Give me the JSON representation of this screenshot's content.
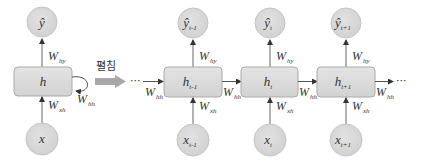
{
  "colors": {
    "node_fill": "#d9d9d9",
    "node_stroke": "#bfbfbf",
    "box_fill": "#dcdcdc",
    "box_stroke": "#a6a6a6",
    "line": "#555555",
    "unfold_arrow": "#a6a6a6",
    "text": "#333333"
  },
  "folded": {
    "output_node": {
      "symbol": "ŷ",
      "sub": ""
    },
    "hidden_box": {
      "symbol": "h",
      "sub": ""
    },
    "input_node": {
      "symbol": "x",
      "sub": ""
    },
    "w_hy": {
      "base": "W",
      "sub": "hy"
    },
    "w_xh": {
      "base": "W",
      "sub": "xh"
    },
    "w_hh": {
      "base": "W",
      "sub": "hh"
    }
  },
  "unfold_label": "펼침",
  "ellipsis": "···",
  "unfolded": [
    {
      "output": {
        "symbol": "ŷ",
        "sub": "t-1"
      },
      "hidden": {
        "symbol": "h",
        "sub": "t-1"
      },
      "input": {
        "symbol": "x",
        "sub": "t-1"
      },
      "w_hy": {
        "base": "W",
        "sub": "hy"
      },
      "w_xh": {
        "base": "W",
        "sub": "xh"
      },
      "w_hh_in": {
        "base": "W",
        "sub": "hh"
      }
    },
    {
      "output": {
        "symbol": "ŷ",
        "sub": "t"
      },
      "hidden": {
        "symbol": "h",
        "sub": "t"
      },
      "input": {
        "symbol": "x",
        "sub": "t"
      },
      "w_hy": {
        "base": "W",
        "sub": "hy"
      },
      "w_xh": {
        "base": "W",
        "sub": "xh"
      },
      "w_hh_in": {
        "base": "W",
        "sub": "hh"
      }
    },
    {
      "output": {
        "symbol": "ŷ",
        "sub": "t+1"
      },
      "hidden": {
        "symbol": "h",
        "sub": "t+1"
      },
      "input": {
        "symbol": "x",
        "sub": "t+1"
      },
      "w_hy": {
        "base": "W",
        "sub": "hy"
      },
      "w_xh": {
        "base": "W",
        "sub": "xh"
      },
      "w_hh_in": {
        "base": "W",
        "sub": "hh"
      }
    }
  ],
  "w_hh_out": {
    "base": "W",
    "sub": "hh"
  }
}
